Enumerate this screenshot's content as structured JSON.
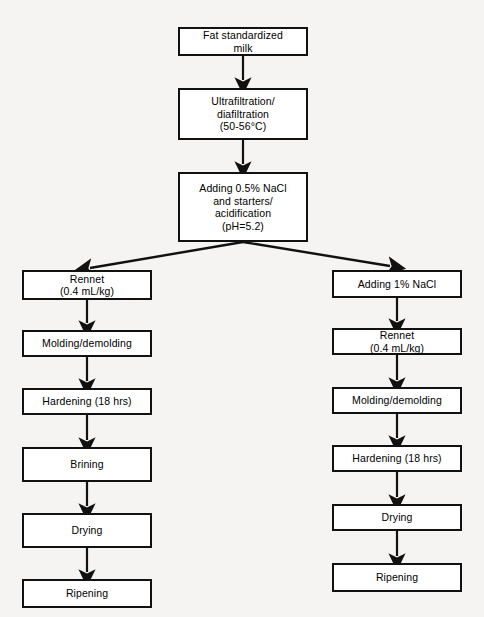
{
  "diagram": {
    "colors": {
      "background": "#f5f4f2",
      "box_fill": "#ffffff",
      "line": "#111111",
      "text": "#000000"
    },
    "nodes": {
      "fat_standardized_milk": "Fat standardized\nmilk",
      "ultrafiltration": "Ultrafiltration/\ndiafiltration\n(50-56°C)",
      "adding_nacl_starters": "Adding 0.5% NaCl\nand starters/\nacidification\n(pH=5.2)",
      "left_rennet": "Rennet\n(0.4 mL/kg)",
      "left_molding": "Molding/demolding",
      "left_hardening": "Hardening (18 hrs)",
      "left_brining": "Brining",
      "left_drying": "Drying",
      "left_ripening": "Ripening",
      "right_adding_nacl": "Adding 1% NaCl",
      "right_rennet": "Rennet\n(0.4 mL/kg)",
      "right_molding": "Molding/demolding",
      "right_hardening": "Hardening (18 hrs)",
      "right_drying": "Drying",
      "right_ripening": "Ripening"
    }
  }
}
